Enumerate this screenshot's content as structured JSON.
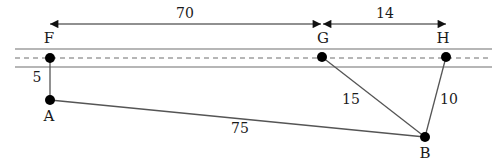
{
  "diagram": {
    "colors": {
      "line": "#555555",
      "road": "#6e6e6e",
      "dot": "#000000",
      "text": "#1a1a1a"
    },
    "points": [
      {
        "id": "F",
        "label": "F",
        "x": 50,
        "y": 58
      },
      {
        "id": "G",
        "label": "G",
        "x": 322,
        "y": 57
      },
      {
        "id": "H",
        "label": "H",
        "x": 446,
        "y": 57
      },
      {
        "id": "A",
        "label": "A",
        "x": 50,
        "y": 100
      },
      {
        "id": "B",
        "label": "B",
        "x": 425,
        "y": 137
      }
    ],
    "segments": [
      {
        "from": "F",
        "to": "A",
        "length_label": "5"
      },
      {
        "from": "A",
        "to": "B",
        "length_label": "75"
      },
      {
        "from": "G",
        "to": "B",
        "length_label": "15"
      },
      {
        "from": "H",
        "to": "B",
        "length_label": "10"
      }
    ],
    "dimensions": [
      {
        "from": "F",
        "to": "G",
        "label": "70"
      },
      {
        "from": "G",
        "to": "H",
        "label": "14"
      }
    ],
    "road": {
      "style": "two solid edge lines with dashed center line"
    }
  }
}
